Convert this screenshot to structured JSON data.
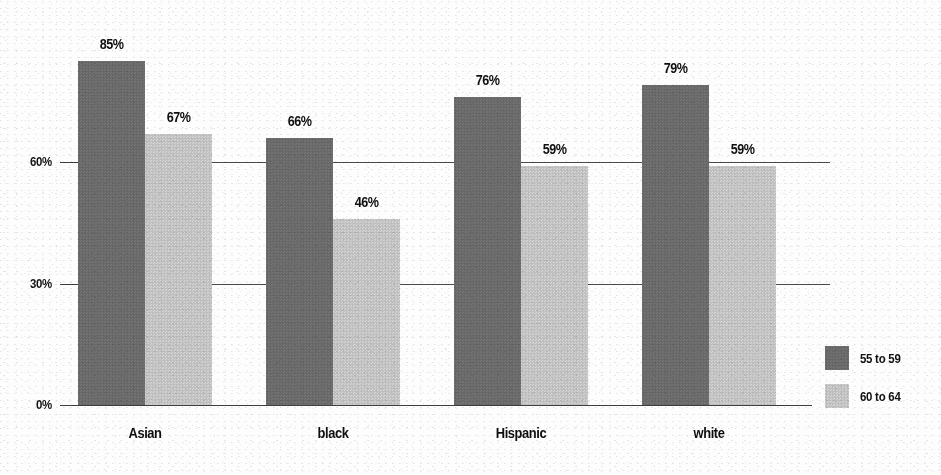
{
  "chart_data": {
    "type": "bar",
    "title": "",
    "subtitle": "",
    "xlabel": "",
    "ylabel": "",
    "ylim": [
      0,
      95
    ],
    "grid": true,
    "grid_axis": "y",
    "legend_position": "right",
    "categories": [
      "Asian",
      "black",
      "Hispanic",
      "white"
    ],
    "ytick_labels": [
      "0%",
      "30%",
      "60%"
    ],
    "ytick_values": [
      0,
      30,
      60
    ],
    "value_label_suffix": "%",
    "series": [
      {
        "name": "55 to 59",
        "color": "#6b6b6b",
        "values": [
          85,
          66,
          76,
          79
        ],
        "value_labels": [
          "85%",
          "66%",
          "76%",
          "79%"
        ]
      },
      {
        "name": "60 to 64",
        "color": "#c4c4c4",
        "values": [
          67,
          46,
          59,
          59
        ],
        "value_labels": [
          "67%",
          "46%",
          "59%",
          "59%"
        ]
      }
    ]
  },
  "colors": {
    "background": "#fdfdfd",
    "axis": "#3d3d3d",
    "gridline": "#4a4a4a",
    "text": "#0f0f0f",
    "series_a": "#6b6b6b",
    "series_b": "#c4c4c4"
  }
}
